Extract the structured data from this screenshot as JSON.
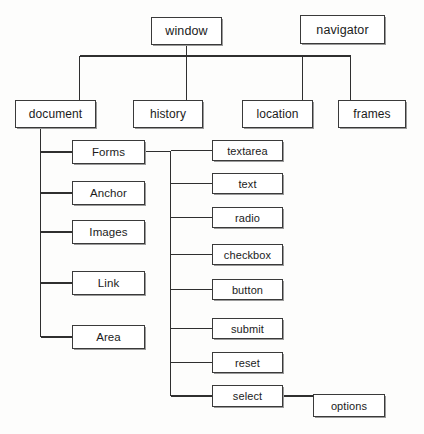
{
  "diagram": {
    "background_color": "#fdfdfc",
    "line_color": "#2f2f2f",
    "box_fill": "#ffffff",
    "box_border_color": "#3a3a3a",
    "text_color": "#1b1b1b",
    "nodes": {
      "window": {
        "label": "window",
        "x": 151,
        "y": 17,
        "w": 71,
        "h": 28,
        "level": 1
      },
      "navigator": {
        "label": "navigator",
        "x": 300,
        "y": 15,
        "w": 85,
        "h": 29,
        "level": 1
      },
      "document": {
        "label": "document",
        "x": 15,
        "y": 100,
        "w": 81,
        "h": 28,
        "level": 2
      },
      "history": {
        "label": "history",
        "x": 133,
        "y": 100,
        "w": 70,
        "h": 28,
        "level": 2
      },
      "location": {
        "label": "location",
        "x": 242,
        "y": 100,
        "w": 71,
        "h": 28,
        "level": 2
      },
      "frames": {
        "label": "frames",
        "x": 338,
        "y": 100,
        "w": 68,
        "h": 28,
        "level": 2
      },
      "forms": {
        "label": "Forms",
        "x": 72,
        "y": 140,
        "w": 73,
        "h": 24,
        "level": 3
      },
      "anchor": {
        "label": "Anchor",
        "x": 72,
        "y": 181,
        "w": 73,
        "h": 24,
        "level": 3
      },
      "images": {
        "label": "Images",
        "x": 72,
        "y": 220,
        "w": 73,
        "h": 24,
        "level": 3
      },
      "link": {
        "label": "Link",
        "x": 72,
        "y": 271,
        "w": 73,
        "h": 24,
        "level": 3
      },
      "area": {
        "label": "Area",
        "x": 72,
        "y": 325,
        "w": 73,
        "h": 24,
        "level": 3
      },
      "textarea": {
        "label": "textarea",
        "x": 212,
        "y": 140,
        "w": 71,
        "h": 21,
        "level": 4
      },
      "text": {
        "label": "text",
        "x": 212,
        "y": 173,
        "w": 71,
        "h": 21,
        "level": 4
      },
      "radio": {
        "label": "radio",
        "x": 212,
        "y": 207,
        "w": 71,
        "h": 21,
        "level": 4
      },
      "checkbox": {
        "label": "checkbox",
        "x": 212,
        "y": 244,
        "w": 71,
        "h": 21,
        "level": 4
      },
      "button": {
        "label": "button",
        "x": 212,
        "y": 279,
        "w": 71,
        "h": 21,
        "level": 4
      },
      "submit": {
        "label": "submit",
        "x": 212,
        "y": 318,
        "w": 71,
        "h": 21,
        "level": 4
      },
      "reset": {
        "label": "reset",
        "x": 212,
        "y": 352,
        "w": 71,
        "h": 21,
        "level": 4
      },
      "select": {
        "label": "select",
        "x": 212,
        "y": 385,
        "w": 71,
        "h": 22,
        "level": 4
      },
      "options": {
        "label": "options",
        "x": 313,
        "y": 394,
        "w": 72,
        "h": 23,
        "level": 4
      }
    },
    "edges": [
      {
        "from": "window",
        "to": "document"
      },
      {
        "from": "window",
        "to": "history"
      },
      {
        "from": "window",
        "to": "location"
      },
      {
        "from": "window",
        "to": "frames"
      },
      {
        "from": "document",
        "to": "forms"
      },
      {
        "from": "document",
        "to": "anchor"
      },
      {
        "from": "document",
        "to": "images"
      },
      {
        "from": "document",
        "to": "link"
      },
      {
        "from": "document",
        "to": "area"
      },
      {
        "from": "forms",
        "to": "textarea"
      },
      {
        "from": "forms",
        "to": "text"
      },
      {
        "from": "forms",
        "to": "radio"
      },
      {
        "from": "forms",
        "to": "checkbox"
      },
      {
        "from": "forms",
        "to": "button"
      },
      {
        "from": "forms",
        "to": "submit"
      },
      {
        "from": "forms",
        "to": "reset"
      },
      {
        "from": "forms",
        "to": "select"
      },
      {
        "from": "select",
        "to": "options"
      }
    ]
  }
}
